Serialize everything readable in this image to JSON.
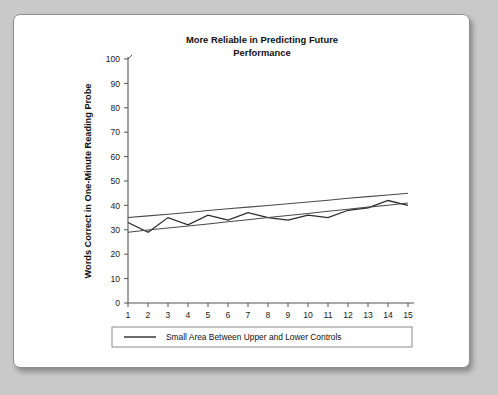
{
  "chart_data": {
    "type": "line",
    "title_line1": "More Reliable in Predicting Future",
    "title_line2": "Performance",
    "xlabel": "Daily Probes",
    "ylabel": "Words Correct in One-Minute Reading Probe",
    "x": [
      1,
      2,
      3,
      4,
      5,
      6,
      7,
      8,
      9,
      10,
      11,
      12,
      13,
      14,
      15
    ],
    "categories": [
      "1",
      "2",
      "3",
      "4",
      "5",
      "6",
      "7",
      "8",
      "9",
      "10",
      "11",
      "12",
      "13",
      "14",
      "15"
    ],
    "xlim": [
      1,
      15
    ],
    "ylim": [
      0,
      100
    ],
    "ytick_values": [
      0,
      10,
      20,
      30,
      40,
      50,
      60,
      70,
      80,
      90,
      100
    ],
    "ytick_labels": [
      "0",
      "10",
      "20",
      "30",
      "40",
      "50",
      "60",
      "70",
      "80",
      "90",
      "100"
    ],
    "grid": false,
    "legend_position": "bottom",
    "series": [
      {
        "name": "Student Performance",
        "role": "data",
        "values": [
          33,
          29,
          35,
          32,
          36,
          34,
          37,
          35,
          34,
          36,
          35,
          38,
          39,
          42,
          40
        ]
      },
      {
        "name": "Upper Control",
        "role": "control-upper",
        "values": [
          35.0,
          35.7,
          36.4,
          37.1,
          37.9,
          38.6,
          39.3,
          40.0,
          40.7,
          41.4,
          42.1,
          42.9,
          43.6,
          44.3,
          45.0
        ]
      },
      {
        "name": "Lower Control",
        "role": "control-lower",
        "values": [
          29.0,
          29.9,
          30.7,
          31.6,
          32.4,
          33.3,
          34.1,
          35.0,
          35.9,
          36.7,
          37.6,
          38.4,
          39.3,
          40.1,
          41.0
        ]
      }
    ],
    "legend": [
      {
        "label": "Small Area Between Upper and Lower Controls",
        "color": "#3a3a3a"
      }
    ]
  },
  "colors": {
    "page_background": "#c9c9c9",
    "card_background": "#ffffff",
    "card_border": "#8e8e8e",
    "axis": "#555555",
    "series_line": "#2b2b2b",
    "control_line": "#4a4a4a",
    "text": "#111111"
  }
}
